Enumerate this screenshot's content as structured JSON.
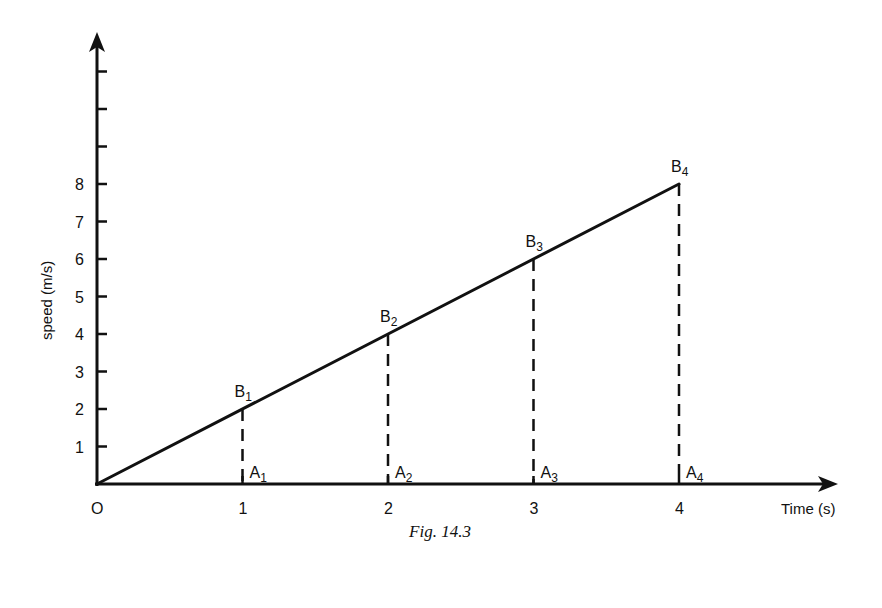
{
  "figure": {
    "caption": "Fig. 14.3",
    "y_axis_label": "speed (m/s)",
    "x_axis_label": "Time (s)",
    "origin_label": "O"
  },
  "colors": {
    "ink": "#111111",
    "background": "#ffffff"
  },
  "chart_data": {
    "type": "line",
    "title": "",
    "caption": "Fig. 14.3",
    "xlabel": "Time (s)",
    "ylabel": "speed (m/s)",
    "x_ticks": [
      "1",
      "2",
      "3",
      "4"
    ],
    "y_ticks": [
      "1",
      "2",
      "3",
      "4",
      "5",
      "6",
      "7",
      "8"
    ],
    "y_unlabeled_ticks_above": 3,
    "xlim": [
      0,
      5
    ],
    "ylim": [
      0,
      11
    ],
    "grid": false,
    "legend": null,
    "series": [
      {
        "name": "speed",
        "style": "solid",
        "x": [
          0,
          4
        ],
        "y": [
          0,
          8
        ]
      }
    ],
    "points": [
      {
        "label": "B",
        "sub": "1",
        "x": 1,
        "y": 2
      },
      {
        "label": "B",
        "sub": "2",
        "x": 2,
        "y": 4
      },
      {
        "label": "B",
        "sub": "3",
        "x": 3,
        "y": 6
      },
      {
        "label": "B",
        "sub": "4",
        "x": 4,
        "y": 8
      }
    ],
    "foot_points": [
      {
        "label": "A",
        "sub": "1",
        "x": 1,
        "y": 0
      },
      {
        "label": "A",
        "sub": "2",
        "x": 2,
        "y": 0
      },
      {
        "label": "A",
        "sub": "3",
        "x": 3,
        "y": 0
      },
      {
        "label": "A",
        "sub": "4",
        "x": 4,
        "y": 0
      }
    ],
    "annotations": [
      "Dashed vertical lines A1B1, A2B2, A3B3, A4B4"
    ]
  }
}
